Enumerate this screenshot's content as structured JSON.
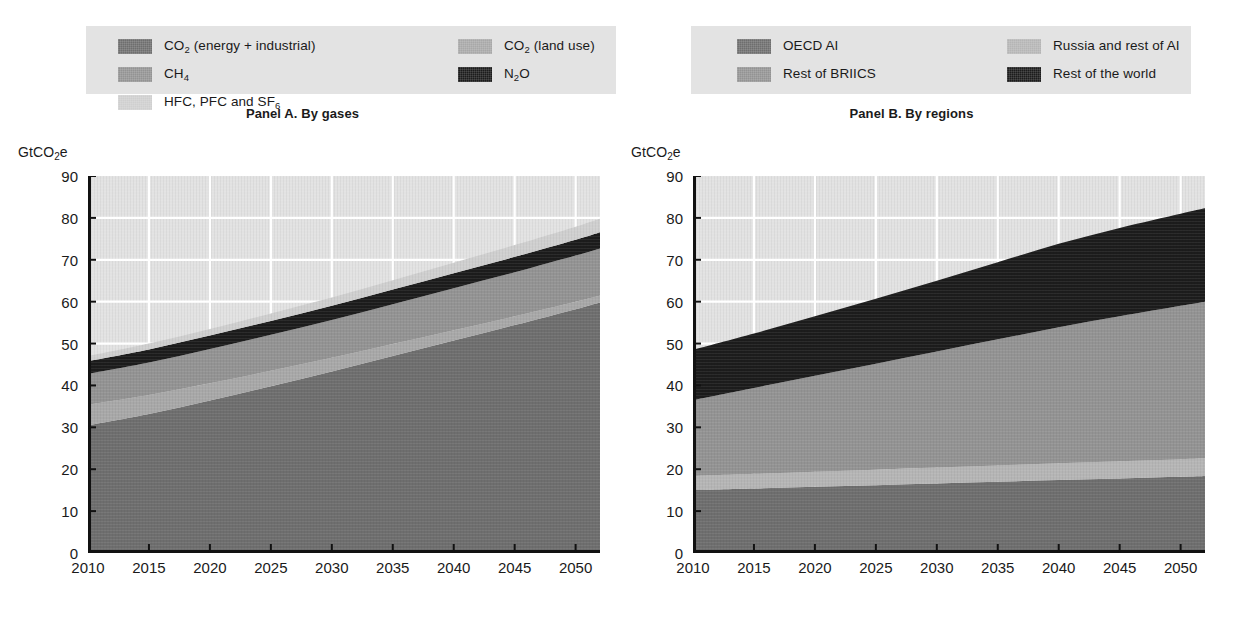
{
  "figure": {
    "unit_label": "GtCO",
    "unit_sub": "2",
    "unit_tail": "e"
  },
  "panel_a": {
    "title": "Panel A. By gases",
    "unit": "GtCO2e",
    "legend": [
      {
        "label": "CO",
        "sub": "2",
        "tail": " (energy + industrial)",
        "color": "#6e6e6e",
        "name": "co2-energy-industrial"
      },
      {
        "label": "CO",
        "sub": "2",
        "tail": " (land use)",
        "color": "#a8a8a8",
        "name": "co2-land-use"
      },
      {
        "label": "CH",
        "sub": "4",
        "tail": "",
        "color": "#939393",
        "name": "ch4"
      },
      {
        "label": "N",
        "sub": "2",
        "tail": "O",
        "color": "#1c1c1c",
        "name": "n2o"
      },
      {
        "label": "HFC, PFC and SF",
        "sub": "6",
        "tail": "",
        "color": "#cfcfcf",
        "name": "hfc-pfc-sf6"
      }
    ],
    "y_ticks": [
      "0",
      "10",
      "20",
      "30",
      "40",
      "50",
      "60",
      "70",
      "80",
      "90"
    ],
    "x_ticks": [
      "2010",
      "2015",
      "2020",
      "2025",
      "2030",
      "2035",
      "2040",
      "2045",
      "2050"
    ]
  },
  "panel_b": {
    "title": "Panel B. By regions",
    "unit": "GtCO2e",
    "legend": [
      {
        "label": "OECD AI",
        "sub": "",
        "tail": "",
        "color": "#6e6e6e",
        "name": "oecd-ai"
      },
      {
        "label": "Russia and rest of AI",
        "sub": "",
        "tail": "",
        "color": "#b5b5b5",
        "name": "russia-rest-of-ai"
      },
      {
        "label": "Rest of BRIICS",
        "sub": "",
        "tail": "",
        "color": "#939393",
        "name": "rest-of-briics"
      },
      {
        "label": "Rest of the world",
        "sub": "",
        "tail": "",
        "color": "#1c1c1c",
        "name": "rest-of-the-world"
      }
    ],
    "y_ticks": [
      "0",
      "10",
      "20",
      "30",
      "40",
      "50",
      "60",
      "70",
      "80",
      "90"
    ],
    "x_ticks": [
      "2010",
      "2015",
      "2020",
      "2025",
      "2030",
      "2035",
      "2040",
      "2045",
      "2050"
    ]
  },
  "chart_data": [
    {
      "type": "area",
      "id": "panel-a",
      "title": "Panel A. By gases",
      "stacked": true,
      "xlabel": "",
      "ylabel": "GtCO2e",
      "ylim": [
        0,
        90
      ],
      "xlim": [
        2010,
        2052
      ],
      "grid": true,
      "legend_position": "top",
      "x": [
        2010,
        2015,
        2020,
        2025,
        2030,
        2035,
        2040,
        2045,
        2050,
        2052
      ],
      "series": [
        {
          "name": "CO2 (energy + industrial)",
          "color": "#6e6e6e",
          "values": [
            30.5,
            33.2,
            36.4,
            39.8,
            43.3,
            47.0,
            50.7,
            54.4,
            58.2,
            59.8
          ]
        },
        {
          "name": "CO2 (land use)",
          "color": "#a8a8a8",
          "values": [
            4.9,
            4.5,
            4.1,
            3.7,
            3.3,
            2.9,
            2.5,
            2.1,
            1.8,
            1.7
          ]
        },
        {
          "name": "CH4",
          "color": "#939393",
          "values": [
            7.4,
            7.8,
            8.2,
            8.6,
            9.0,
            9.5,
            10.0,
            10.5,
            11.0,
            11.2
          ]
        },
        {
          "name": "N2O",
          "color": "#1c1c1c",
          "values": [
            3.0,
            3.1,
            3.2,
            3.3,
            3.4,
            3.5,
            3.6,
            3.7,
            3.8,
            3.9
          ]
        },
        {
          "name": "HFC, PFC and SF6",
          "color": "#cfcfcf",
          "values": [
            1.2,
            1.4,
            1.6,
            1.8,
            2.0,
            2.2,
            2.5,
            2.8,
            3.1,
            3.2
          ]
        }
      ],
      "totals": [
        47.0,
        50.0,
        53.5,
        57.2,
        61.0,
        65.1,
        69.3,
        73.5,
        77.9,
        79.8
      ]
    },
    {
      "type": "area",
      "id": "panel-b",
      "title": "Panel B. By regions",
      "stacked": true,
      "xlabel": "",
      "ylabel": "GtCO2e",
      "ylim": [
        0,
        90
      ],
      "xlim": [
        2010,
        2052
      ],
      "grid": true,
      "legend_position": "top",
      "x": [
        2010,
        2015,
        2020,
        2025,
        2030,
        2035,
        2040,
        2045,
        2050,
        2052
      ],
      "series": [
        {
          "name": "OECD AI",
          "color": "#6e6e6e",
          "values": [
            15.0,
            15.4,
            15.8,
            16.2,
            16.6,
            17.0,
            17.4,
            17.8,
            18.2,
            18.4
          ]
        },
        {
          "name": "Russia and rest of AI",
          "color": "#b5b5b5",
          "values": [
            3.4,
            3.5,
            3.6,
            3.7,
            3.8,
            3.9,
            4.0,
            4.1,
            4.2,
            4.3
          ]
        },
        {
          "name": "Rest of BRIICS",
          "color": "#939393",
          "values": [
            18.1,
            20.5,
            22.9,
            25.3,
            27.7,
            30.1,
            32.5,
            34.6,
            36.6,
            37.3
          ]
        },
        {
          "name": "Rest of the world",
          "color": "#1c1c1c",
          "values": [
            12.0,
            13.0,
            14.2,
            15.5,
            16.9,
            18.4,
            19.9,
            21.1,
            22.0,
            22.3
          ]
        }
      ],
      "totals": [
        48.5,
        52.4,
        56.5,
        60.7,
        65.0,
        69.4,
        73.8,
        77.6,
        81.0,
        82.3
      ]
    }
  ]
}
